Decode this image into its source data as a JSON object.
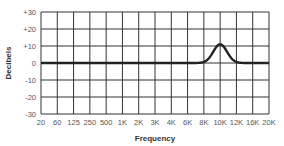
{
  "chart_data": {
    "type": "line",
    "title": "",
    "xlabel": "Frequency",
    "ylabel": "Decibels",
    "categories": [
      "20",
      "60",
      "125",
      "250",
      "500",
      "1K",
      "2K",
      "3K",
      "4K",
      "6K",
      "8K",
      "10K",
      "12K",
      "16K",
      "20K"
    ],
    "y_ticks": [
      "+30",
      "+20",
      "+10",
      "0",
      "-10",
      "-20",
      "-30"
    ],
    "ylim": [
      -30,
      30
    ],
    "grid": true,
    "legend": "none",
    "series": [
      {
        "name": "EQ response",
        "values": [
          0,
          0,
          0,
          0,
          0,
          0,
          0,
          0,
          0,
          0,
          0,
          11,
          0,
          0,
          0
        ],
        "description": "Flat at 0 dB with a bell-shaped boost peaking around +11 dB at 10K, spanning roughly 8K to 12K"
      }
    ]
  },
  "colors": {
    "grid": "#333333",
    "curve": "#222222",
    "background": "#ffffff"
  }
}
